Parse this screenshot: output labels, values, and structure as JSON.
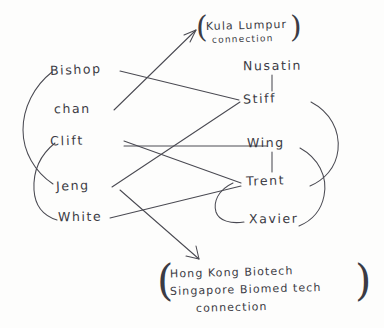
{
  "diagram": {
    "ink_color": "#4a4a52",
    "paper_color": "#fdfdfc",
    "left_column": [
      {
        "id": "bishop",
        "label": "Bishop"
      },
      {
        "id": "chan",
        "label": "chan"
      },
      {
        "id": "clift",
        "label": "Clift"
      },
      {
        "id": "jeng",
        "label": "Jeng"
      },
      {
        "id": "white",
        "label": "White"
      }
    ],
    "right_column": [
      {
        "id": "nusatin",
        "label": "Nusatin"
      },
      {
        "id": "stiff",
        "label": "Stiff"
      },
      {
        "id": "wing",
        "label": "Wing"
      },
      {
        "id": "trent",
        "label": "Trent"
      },
      {
        "id": "xavier",
        "label": "Xavier"
      }
    ],
    "annotations": [
      {
        "id": "kuala-lumpur",
        "line1": "Kula Lumpur",
        "line2": "connection",
        "open_paren": "(",
        "close_paren": ")"
      },
      {
        "id": "hongkong-singapore",
        "line1": "Hong Kong Biotech",
        "line2": "Singapore Biomed tech",
        "line3": "connection",
        "open_paren": "(",
        "close_paren": ")"
      }
    ],
    "edges": [
      {
        "from": "chan",
        "to": "kuala-lumpur",
        "kind": "arrow"
      },
      {
        "from": "white",
        "to": "hongkong-singapore",
        "kind": "arrow"
      },
      {
        "from": "bishop",
        "to": "stiff",
        "kind": "line"
      },
      {
        "from": "clift",
        "to": "trent",
        "kind": "line"
      },
      {
        "from": "clift",
        "to": "wing",
        "kind": "line"
      },
      {
        "from": "jeng",
        "to": "stiff",
        "kind": "line"
      },
      {
        "from": "white",
        "to": "trent",
        "kind": "line"
      },
      {
        "from": "nusatin",
        "to": "stiff",
        "kind": "vertical"
      },
      {
        "from": "wing",
        "to": "trent",
        "kind": "vertical"
      }
    ],
    "brackets": [
      {
        "id": "left-bracket-upper",
        "from": "bishop",
        "to": "jeng",
        "side": "left"
      },
      {
        "id": "left-bracket-lower",
        "from": "clift",
        "to": "white",
        "side": "left"
      },
      {
        "id": "right-bracket-upper",
        "from": "stiff",
        "to": "trent",
        "side": "right"
      },
      {
        "id": "right-bracket-lower",
        "from": "wing",
        "to": "xavier",
        "side": "right"
      },
      {
        "id": "right-bracket-inner",
        "from": "trent",
        "to": "xavier",
        "side": "inner"
      }
    ]
  }
}
